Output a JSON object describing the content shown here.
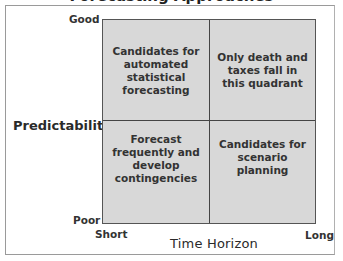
{
  "title": "Forecasting Approaches",
  "y_axis": {
    "label": "Predictability",
    "high": "Good",
    "low": "Poor"
  },
  "x_axis": {
    "label": "Time Horizon",
    "low": "Short",
    "high": "Long"
  },
  "quadrants": {
    "top_left": "Candidates for automated statistical forecasting",
    "top_right": "Only death and taxes fall in this quadrant",
    "bottom_left": "Forecast frequently and develop contingencies",
    "bottom_right": "Candidates for scenario planning"
  },
  "colors": {
    "quadrant_fill": "#d8d8d8",
    "grid_lines": "#444444",
    "text": "#333333"
  }
}
